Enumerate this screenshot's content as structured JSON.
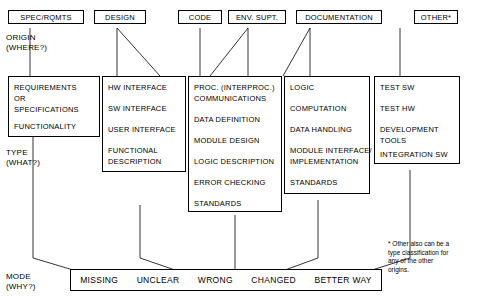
{
  "diagram": {
    "title_labels": [
      {
        "line1": "ORIGIN",
        "line2": "(WHERE?)"
      },
      {
        "line1": "TYPE",
        "line2": "(WHAT?)"
      },
      {
        "line1": "MODE",
        "line2": "(WHY?)"
      }
    ],
    "origin_boxes": [
      {
        "label": "SPEC/RQMTS"
      },
      {
        "label": "DESIGN"
      },
      {
        "label": "CODE"
      },
      {
        "label": "ENV. SUPT."
      },
      {
        "label": "DOCUMENTATION"
      },
      {
        "label": "OTHER*"
      }
    ],
    "type_columns": [
      {
        "items": [
          "REQUIREMENTS",
          "OR",
          "SPECIFICATIONS",
          "FUNCTIONALITY"
        ]
      },
      {
        "items": [
          "HW INTERFACE",
          "SW INTERFACE",
          "USER INTERFACE",
          "FUNCTIONAL",
          "DESCRIPTION"
        ]
      },
      {
        "items": [
          "PROC. (INTERPROC.)",
          "COMMUNICATIONS",
          "DATA DEFINITION",
          "MODULE DESIGN",
          "LOGIC DESCRIPTION",
          "ERROR CHECKING",
          "STANDARDS"
        ]
      },
      {
        "items": [
          "LOGIC",
          "COMPUTATION",
          "DATA HANDLING",
          "MODULE INTERFACE/",
          "IMPLEMENTATION",
          "STANDARDS"
        ]
      },
      {
        "items": [
          "TEST SW",
          "TEST HW",
          "DEVELOPMENT",
          "TOOLS",
          "INTEGRATION SW"
        ]
      }
    ],
    "mode_items": [
      "MISSING",
      "UNCLEAR",
      "WRONG",
      "CHANGED",
      "BETTER WAY"
    ],
    "footnote": {
      "line1": "* Other also can be a",
      "line2": "type classification for",
      "line3": "any of the other",
      "line4": "origins."
    }
  }
}
